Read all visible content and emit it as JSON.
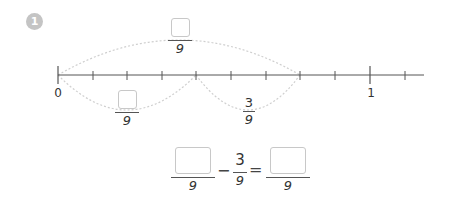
{
  "problem": {
    "number": "1"
  },
  "number_line": {
    "start_label": "0",
    "end_label": "1",
    "divisions": 9,
    "ticks_x": [
      58,
      93,
      127,
      162,
      196,
      231,
      266,
      300,
      335,
      370,
      405
    ],
    "top_arc_fraction": {
      "numerator": "",
      "denominator": "9"
    },
    "bottom_left_arc_fraction": {
      "numerator": "",
      "denominator": "9"
    },
    "bottom_right_arc_fraction": {
      "numerator": "3",
      "denominator": "9"
    }
  },
  "equation": {
    "term1": {
      "numerator": "",
      "denominator": "9"
    },
    "operator": "−",
    "term2": {
      "numerator": "3",
      "denominator": "9"
    },
    "equals": "=",
    "result": {
      "numerator": "",
      "denominator": "9"
    }
  },
  "colors": {
    "badge": "#c4c4c4",
    "line": "#555555",
    "arc": "#cfcfcf",
    "box_border": "#c8c8c8"
  }
}
